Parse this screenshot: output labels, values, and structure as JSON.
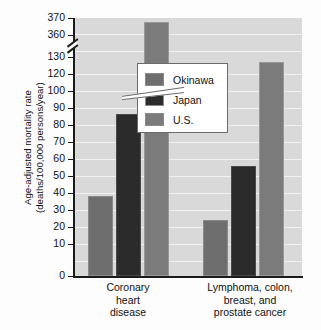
{
  "chart_data": {
    "type": "bar",
    "title": "",
    "xlabel": "",
    "ylabel": "Age-adjusted mortality rate (deaths/100,000 persons/year)",
    "ylabel_line1": "Age-adjusted mortality rate",
    "ylabel_line2": "(deaths/100,000 persons/year)",
    "categories": [
      "Coronary heart disease",
      "Lymphoma, colon, breast, and prostate cancer"
    ],
    "category_lines": [
      [
        "Coronary",
        "heart",
        "disease"
      ],
      [
        "Lymphoma, colon,",
        "breast, and",
        "prostate cancer"
      ]
    ],
    "series": [
      {
        "name": "Okinawa",
        "color": "#6e6e6e",
        "values": [
          46,
          32
        ]
      },
      {
        "name": "Japan",
        "color": "#2b2b2b",
        "values": [
          93,
          63
        ]
      },
      {
        "name": "U.S.",
        "color": "#7b7b7b",
        "values": [
          368,
          123
        ]
      }
    ],
    "ylim": [
      0,
      370
    ],
    "axis_break": {
      "below": 130,
      "above": 360,
      "present": true
    },
    "yticks": [
      0,
      10,
      20,
      30,
      40,
      50,
      60,
      70,
      80,
      90,
      100,
      120,
      130,
      360,
      370
    ],
    "ytick_labels": [
      "0",
      "10",
      "20",
      "30",
      "40",
      "50",
      "60",
      "70",
      "80",
      "90",
      "100",
      "120",
      "130",
      "360",
      "370"
    ],
    "grid": true,
    "legend_position": "upper-right-inside",
    "plot_background": "#d9d9d9",
    "gridline_color": "#f2f2f2"
  },
  "legend": {
    "items": [
      {
        "label": "Okinawa"
      },
      {
        "label": "Japan"
      },
      {
        "label": "U.S."
      }
    ]
  }
}
